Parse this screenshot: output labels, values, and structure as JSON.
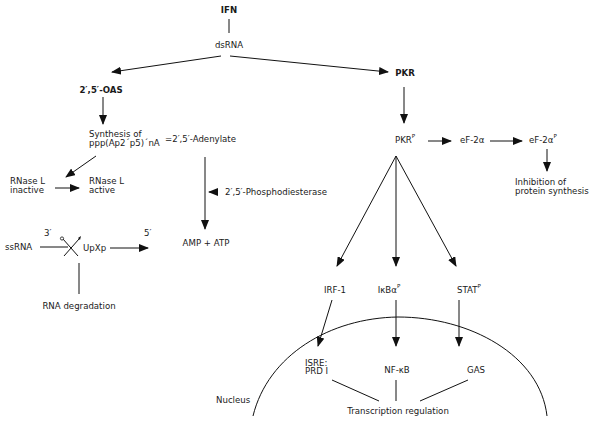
{
  "diagram": {
    "nodes": {
      "ifn": "IFN",
      "dsrna": "dsRNA",
      "oas": "2′,5′-OAS",
      "pkr": "PKR",
      "synthesis_line1": "Synthesis of",
      "synthesis_line2": "ppp(Ap2´p5)´nA",
      "adenylate": "=2′,5′-Adenylate",
      "rnase_inactive_line1": "RNase L",
      "rnase_inactive_line2": "inactive",
      "rnase_active_line1": "RNase L",
      "rnase_active_line2": "active",
      "phosphodiesterase": "2′,5′-Phosphodiesterase",
      "amp_atp": "AMP + ATP",
      "ssrna": "ssRNA",
      "three_prime": "3′",
      "five_prime": "5′",
      "upxp": "UpXp",
      "rna_degradation": "RNA degradation",
      "pkr_p": "PKR",
      "pkr_p_sup": "P",
      "eif2a": "eF-2α",
      "eif2a_p": "eF-2α",
      "eif2a_p_sup": "P",
      "inhibition_line1": "Inhibition of",
      "inhibition_line2": "protein synthesis",
      "irf1": "IRF-1",
      "ikba": "IκBα",
      "ikba_sup": "P",
      "stat": "STAT",
      "stat_sup": "P",
      "isre_line1": "ISRE:",
      "isre_line2": "PRD  I",
      "nfkb": "NF-κB",
      "gas": "GAS",
      "nucleus": "Nucleus",
      "transcription": "Transcription regulation"
    },
    "edges": [
      {
        "from": "IFN",
        "to": "dsRNA",
        "type": "line"
      },
      {
        "from": "dsRNA",
        "to": "2',5'-OAS",
        "type": "arrow"
      },
      {
        "from": "dsRNA",
        "to": "PKR",
        "type": "arrow"
      },
      {
        "from": "2',5'-OAS",
        "to": "Synthesis of ppp(Ap2'p5)'nA",
        "type": "arrow"
      },
      {
        "from": "Synthesis",
        "to": "RNase L inactive",
        "type": "arrow"
      },
      {
        "from": "RNase L inactive",
        "to": "RNase L active",
        "type": "arrow"
      },
      {
        "from": "2',5'-Adenylate",
        "to": "AMP + ATP",
        "type": "arrow"
      },
      {
        "from": "2',5'-Phosphodiesterase",
        "to": "adenylate-arrow",
        "type": "arrow"
      },
      {
        "from": "ssRNA",
        "to": "UpXp",
        "type": "cleavage"
      },
      {
        "from": "UpXp",
        "to": "5'",
        "type": "arrow"
      },
      {
        "from": "cleavage",
        "to": "RNA degradation",
        "type": "line"
      },
      {
        "from": "PKR",
        "to": "PKR-P",
        "type": "arrow"
      },
      {
        "from": "PKR-P",
        "to": "eF-2alpha",
        "type": "arrow"
      },
      {
        "from": "eF-2alpha",
        "to": "eF-2alpha-P",
        "type": "arrow"
      },
      {
        "from": "eF-2alpha-P",
        "to": "Inhibition of protein synthesis",
        "type": "arrow"
      },
      {
        "from": "PKR-P",
        "to": "IRF-1",
        "type": "arrow"
      },
      {
        "from": "PKR-P",
        "to": "IkBa-P",
        "type": "arrow"
      },
      {
        "from": "PKR-P",
        "to": "STAT-P",
        "type": "arrow"
      },
      {
        "from": "IRF-1",
        "to": "ISRE: PRD I",
        "type": "arrow"
      },
      {
        "from": "IkBa-P",
        "to": "NF-kB",
        "type": "arrow"
      },
      {
        "from": "STAT-P",
        "to": "GAS",
        "type": "arrow"
      },
      {
        "from": "ISRE: PRD I",
        "to": "Transcription regulation",
        "type": "line"
      },
      {
        "from": "NF-kB",
        "to": "Transcription regulation",
        "type": "line"
      },
      {
        "from": "GAS",
        "to": "Transcription regulation",
        "type": "line"
      }
    ]
  }
}
